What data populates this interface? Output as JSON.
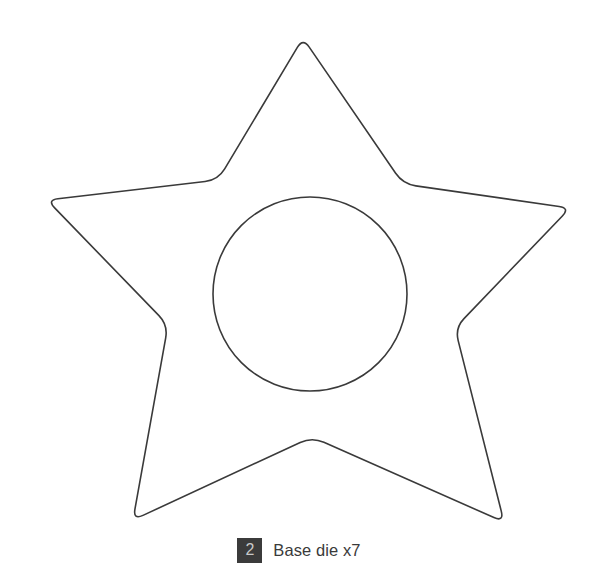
{
  "page": {
    "background_color": "#ffffff",
    "width": 598,
    "height": 564
  },
  "diagram": {
    "name": "star-base-die-template",
    "stroke_color": "#3a3a3a",
    "stroke_width": 1.6,
    "fill_color": "none",
    "shapes": [
      {
        "name": "rounded-five-point-star-outline",
        "type": "star",
        "points": 5,
        "outer_vertices": [
          [
            303,
            38
          ],
          [
            570,
            208
          ],
          [
            504,
            522
          ],
          [
            133,
            520
          ],
          [
            47,
            200
          ]
        ],
        "inner_vertices": [
          [
            403,
            184
          ],
          [
            455,
            328
          ],
          [
            312,
            437
          ],
          [
            168,
            325
          ],
          [
            218,
            180
          ]
        ],
        "corner_rounding": "rounded"
      },
      {
        "name": "inner-circle-cutout",
        "type": "circle",
        "center": [
          310,
          294
        ],
        "radius": 97
      }
    ]
  },
  "caption": {
    "step_number": "2",
    "badge_background": "#3b3b3b",
    "badge_text_color": "#c9c9c9",
    "label": "Base die x7",
    "label_color": "#3a3a3a"
  }
}
